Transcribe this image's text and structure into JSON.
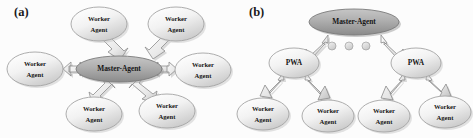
{
  "figure": {
    "background_color": "#fcfcfc",
    "panels": [
      {
        "id": "a",
        "label": "(a)",
        "topology": "star",
        "description": "Flat master-worker star topology: a central Master-Agent connected by bidirectional block arrows to six Worker Agents arranged radially around it.",
        "nodes": [
          {
            "id": "a-master",
            "type": "master",
            "line1": "Master-Agent",
            "line2": "",
            "cx": 119,
            "cy": 69,
            "rx": 43,
            "ry": 13,
            "fill_top": "#b9b9b9",
            "fill_bottom": "#8f8f8f",
            "stroke": "#7d7d7d"
          },
          {
            "id": "a-worker-1",
            "type": "worker",
            "line1": "Worker",
            "line2": "Agent",
            "cx": 99,
            "cy": 24,
            "rx": 28,
            "ry": 17,
            "fill_top": "#fdfdfd",
            "fill_bottom": "#cfcfcf",
            "stroke": "#a6a6a6"
          },
          {
            "id": "a-worker-2",
            "type": "worker",
            "line1": "Worker",
            "line2": "Agent",
            "cx": 176,
            "cy": 24,
            "rx": 28,
            "ry": 17,
            "fill_top": "#fdfdfd",
            "fill_bottom": "#cfcfcf",
            "stroke": "#a6a6a6"
          },
          {
            "id": "a-worker-3",
            "type": "worker",
            "line1": "Worker",
            "line2": "Agent",
            "cx": 35,
            "cy": 69,
            "rx": 28,
            "ry": 17,
            "fill_top": "#fdfdfd",
            "fill_bottom": "#cfcfcf",
            "stroke": "#a6a6a6"
          },
          {
            "id": "a-worker-4",
            "type": "worker",
            "line1": "Worker",
            "line2": "Agent",
            "cx": 203,
            "cy": 70,
            "rx": 28,
            "ry": 17,
            "fill_top": "#fdfdfd",
            "fill_bottom": "#cfcfcf",
            "stroke": "#a6a6a6"
          },
          {
            "id": "a-worker-5",
            "type": "worker",
            "line1": "Worker",
            "line2": "Agent",
            "cx": 94,
            "cy": 114,
            "rx": 28,
            "ry": 17,
            "fill_top": "#fdfdfd",
            "fill_bottom": "#cfcfcf",
            "stroke": "#a6a6a6"
          },
          {
            "id": "a-worker-6",
            "type": "worker",
            "line1": "Worker",
            "line2": "Agent",
            "cx": 167,
            "cy": 111,
            "rx": 28,
            "ry": 17,
            "fill_top": "#fdfdfd",
            "fill_bottom": "#cfcfcf",
            "stroke": "#a6a6a6"
          }
        ],
        "edges": [
          {
            "id": "a-edge-1",
            "from": "a-worker-1",
            "to": "a-master",
            "heads": "double"
          },
          {
            "id": "a-edge-2",
            "from": "a-worker-2",
            "to": "a-master",
            "heads": "double"
          },
          {
            "id": "a-edge-3",
            "from": "a-worker-3",
            "to": "a-master",
            "heads": "double"
          },
          {
            "id": "a-edge-4",
            "from": "a-worker-4",
            "to": "a-master",
            "heads": "double"
          },
          {
            "id": "a-edge-5",
            "from": "a-worker-5",
            "to": "a-master",
            "heads": "double"
          },
          {
            "id": "a-edge-6",
            "from": "a-worker-6",
            "to": "a-master",
            "heads": "double"
          }
        ]
      },
      {
        "id": "b",
        "label": "(b)",
        "topology": "hierarchical",
        "description": "Hierarchical topology: a top Master-Agent delegates via block arrows to two PWA nodes (with an ellipsis of three dots indicating more), each PWA branching down to two Worker Agents.",
        "nodes": [
          {
            "id": "b-master",
            "type": "master",
            "line1": "Master-Agent",
            "line2": "",
            "cx": 118,
            "cy": 22,
            "rx": 45,
            "ry": 13,
            "fill_top": "#b9b9b9",
            "fill_bottom": "#8f8f8f",
            "stroke": "#7d7d7d"
          },
          {
            "id": "b-pwa-left",
            "type": "pwa",
            "line1": "PWA",
            "line2": "",
            "cx": 58,
            "cy": 63,
            "rx": 25,
            "ry": 15,
            "fill_top": "#fdfdfd",
            "fill_bottom": "#cfcfcf",
            "stroke": "#a6a6a6"
          },
          {
            "id": "b-pwa-right",
            "type": "pwa",
            "line1": "PWA",
            "line2": "",
            "cx": 180,
            "cy": 63,
            "rx": 25,
            "ry": 15,
            "fill_top": "#fdfdfd",
            "fill_bottom": "#cfcfcf",
            "stroke": "#a6a6a6"
          },
          {
            "id": "b-worker-1",
            "type": "worker",
            "line1": "Worker",
            "line2": "Agent",
            "cx": 27,
            "cy": 114,
            "rx": 26,
            "ry": 16,
            "fill_top": "#fdfdfd",
            "fill_bottom": "#cfcfcf",
            "stroke": "#a6a6a6"
          },
          {
            "id": "b-worker-2",
            "type": "worker",
            "line1": "Worker",
            "line2": "Agent",
            "cx": 92,
            "cy": 116,
            "rx": 26,
            "ry": 16,
            "fill_top": "#fdfdfd",
            "fill_bottom": "#cfcfcf",
            "stroke": "#a6a6a6"
          },
          {
            "id": "b-worker-3",
            "type": "worker",
            "line1": "Worker",
            "line2": "Agent",
            "cx": 148,
            "cy": 116,
            "rx": 26,
            "ry": 16,
            "fill_top": "#fdfdfd",
            "fill_bottom": "#cfcfcf",
            "stroke": "#a6a6a6"
          },
          {
            "id": "b-worker-4",
            "type": "worker",
            "line1": "Worker",
            "line2": "Agent",
            "cx": 209,
            "cy": 112,
            "rx": 26,
            "ry": 16,
            "fill_top": "#fdfdfd",
            "fill_bottom": "#cfcfcf",
            "stroke": "#a6a6a6"
          }
        ],
        "edges": [
          {
            "id": "b-edge-1",
            "from": "b-master",
            "to": "b-pwa-left",
            "heads": "single"
          },
          {
            "id": "b-edge-2",
            "from": "b-master",
            "to": "b-pwa-right",
            "heads": "single"
          },
          {
            "id": "b-edge-3",
            "from": "b-pwa-left",
            "to": "b-worker-1",
            "heads": "single"
          },
          {
            "id": "b-edge-4",
            "from": "b-pwa-left",
            "to": "b-worker-2",
            "heads": "single"
          },
          {
            "id": "b-edge-5",
            "from": "b-pwa-right",
            "to": "b-worker-3",
            "heads": "single"
          },
          {
            "id": "b-edge-6",
            "from": "b-pwa-right",
            "to": "b-worker-4",
            "heads": "single"
          }
        ],
        "ellipsis": {
          "id": "b-ellipsis",
          "count": 3,
          "dots": [
            {
              "cx": 96,
              "cy": 46,
              "r": 4
            },
            {
              "cx": 113,
              "cy": 46,
              "r": 4
            },
            {
              "cx": 130,
              "cy": 46,
              "r": 4
            }
          ],
          "fill": "#d8d8d8",
          "stroke": "#9e9e9e"
        }
      }
    ]
  },
  "colors": {
    "master_fill_top": "#b9b9b9",
    "master_fill_bottom": "#8f8f8f",
    "node_fill_top": "#fdfdfd",
    "node_fill_bottom": "#cfcfcf",
    "node_stroke": "#a6a6a6",
    "arrow_fill": "#efefef",
    "arrow_stroke": "#8a8a8a",
    "arrow_shadow": "#b4b4b4",
    "text": "#161616"
  }
}
